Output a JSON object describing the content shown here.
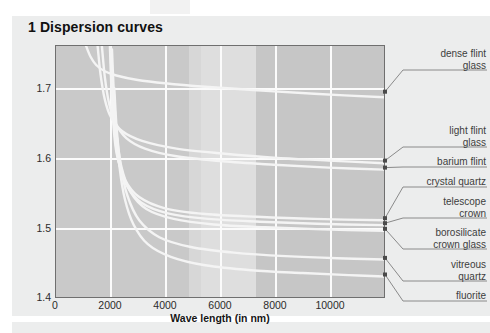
{
  "figure": {
    "title": "1 Dispersion curves"
  },
  "chart_data": {
    "type": "line",
    "title": "1 Dispersion curves",
    "xlabel": "Wave length (in nm)",
    "ylabel": "Refractive index",
    "xlim": [
      0,
      11500
    ],
    "ylim": [
      1.4,
      1.76
    ],
    "xticks": [
      "0",
      "2000",
      "4000",
      "6000",
      "8000",
      "10000"
    ],
    "xtick_values": [
      0,
      2000,
      4000,
      6000,
      8000,
      10000
    ],
    "yticks": [
      "1.7",
      "1.6",
      "1.5",
      "1.4"
    ],
    "ytick_values": [
      1.7,
      1.6,
      1.5,
      1.4
    ],
    "grid": true,
    "legend_position": "right-callouts",
    "series": [
      {
        "name": "dense flint glass",
        "points": [
          [
            1050,
            1.76
          ],
          [
            1200,
            1.745
          ],
          [
            1400,
            1.733
          ],
          [
            1700,
            1.724
          ],
          [
            2100,
            1.718
          ],
          [
            2800,
            1.712
          ],
          [
            3800,
            1.707
          ],
          [
            5200,
            1.702
          ],
          [
            7000,
            1.697
          ],
          [
            9000,
            1.692
          ],
          [
            11500,
            1.687
          ]
        ]
      },
      {
        "name": "light flint glass",
        "points": [
          [
            1450,
            1.76
          ],
          [
            1550,
            1.72
          ],
          [
            1700,
            1.684
          ],
          [
            1900,
            1.66
          ],
          [
            2300,
            1.639
          ],
          [
            3000,
            1.625
          ],
          [
            4200,
            1.614
          ],
          [
            5800,
            1.607
          ],
          [
            7600,
            1.601
          ],
          [
            9500,
            1.597
          ],
          [
            11500,
            1.593
          ]
        ]
      },
      {
        "name": "barium flint",
        "points": [
          [
            1600,
            1.76
          ],
          [
            1700,
            1.716
          ],
          [
            1850,
            1.678
          ],
          [
            2050,
            1.652
          ],
          [
            2450,
            1.629
          ],
          [
            3100,
            1.614
          ],
          [
            4200,
            1.603
          ],
          [
            5800,
            1.596
          ],
          [
            7600,
            1.591
          ],
          [
            9500,
            1.587
          ],
          [
            11500,
            1.584
          ]
        ]
      },
      {
        "name": "crystal quartz",
        "points": [
          [
            1880,
            1.76
          ],
          [
            1930,
            1.7
          ],
          [
            2000,
            1.648
          ],
          [
            2120,
            1.606
          ],
          [
            2400,
            1.57
          ],
          [
            2900,
            1.545
          ],
          [
            3800,
            1.529
          ],
          [
            5200,
            1.521
          ],
          [
            7000,
            1.517
          ],
          [
            9000,
            1.514
          ],
          [
            11500,
            1.512
          ]
        ]
      },
      {
        "name": "telescope crown",
        "points": [
          [
            1900,
            1.76
          ],
          [
            1960,
            1.695
          ],
          [
            2040,
            1.64
          ],
          [
            2170,
            1.598
          ],
          [
            2460,
            1.562
          ],
          [
            2980,
            1.537
          ],
          [
            3900,
            1.522
          ],
          [
            5300,
            1.514
          ],
          [
            7100,
            1.51
          ],
          [
            9100,
            1.507
          ],
          [
            11500,
            1.505
          ]
        ]
      },
      {
        "name": "borosilicate crown glass",
        "points": [
          [
            1950,
            1.755
          ],
          [
            2020,
            1.69
          ],
          [
            2120,
            1.632
          ],
          [
            2280,
            1.588
          ],
          [
            2600,
            1.552
          ],
          [
            3150,
            1.528
          ],
          [
            4100,
            1.514
          ],
          [
            5500,
            1.506
          ],
          [
            7300,
            1.502
          ],
          [
            9300,
            1.499
          ],
          [
            11500,
            1.497
          ]
        ]
      },
      {
        "name": "vitreous quartz",
        "points": [
          [
            2030,
            1.7
          ],
          [
            2120,
            1.64
          ],
          [
            2260,
            1.588
          ],
          [
            2480,
            1.548
          ],
          [
            2900,
            1.512
          ],
          [
            3600,
            1.488
          ],
          [
            4700,
            1.474
          ],
          [
            6200,
            1.466
          ],
          [
            8000,
            1.461
          ],
          [
            9800,
            1.458
          ],
          [
            11500,
            1.456
          ]
        ]
      },
      {
        "name": "fluorite",
        "points": [
          [
            2100,
            1.64
          ],
          [
            2220,
            1.586
          ],
          [
            2400,
            1.542
          ],
          [
            2700,
            1.506
          ],
          [
            3200,
            1.478
          ],
          [
            4000,
            1.46
          ],
          [
            5200,
            1.448
          ],
          [
            6800,
            1.441
          ],
          [
            8600,
            1.437
          ],
          [
            10200,
            1.434
          ],
          [
            11500,
            1.432
          ]
        ]
      }
    ],
    "callouts": [
      {
        "label": "dense flint\nglass",
        "anchor_y": 1.6935
      },
      {
        "label": "light flint\nglass",
        "anchor_y": 1.5955
      },
      {
        "label": "barium flint",
        "anchor_y": 1.5855
      },
      {
        "label": "crystal quartz",
        "anchor_y": 1.5135
      },
      {
        "label": "telescope\ncrown",
        "anchor_y": 1.5065
      },
      {
        "label": "borosilicate\ncrown glass",
        "anchor_y": 1.4985
      },
      {
        "label": "vitreous\nquartz",
        "anchor_y": 1.457
      },
      {
        "label": "fluorite",
        "anchor_y": 1.4335
      }
    ]
  },
  "colors": {
    "page_panel": "#eceded",
    "plot_background": "#c9c9c9",
    "plot_border": "#6f6f6f",
    "gridline": "#fbfbfb",
    "curve": "#f4f4f4",
    "leader": "#8a8a8a",
    "label_text": "#3d3d3d",
    "axis_text": "#2b2b2b",
    "title_text": "#111111"
  }
}
